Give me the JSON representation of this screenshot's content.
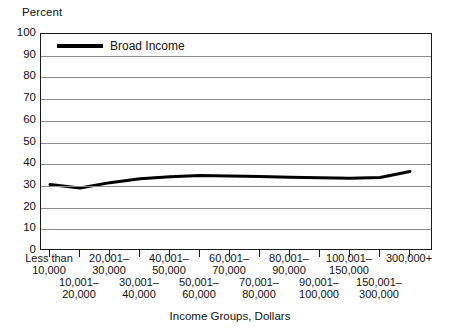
{
  "chart_data": {
    "type": "line",
    "title": "",
    "ylabel": "Percent",
    "xlabel": "Income Groups, Dollars",
    "ylim": [
      0,
      100
    ],
    "yticks": [
      0,
      10,
      20,
      30,
      40,
      50,
      60,
      70,
      80,
      90,
      100
    ],
    "grid": true,
    "legend_position": "inside-top-left",
    "categories": [
      "Less than 10,000",
      "10,001-20,000",
      "20,001-30,000",
      "30,001-40,000",
      "40,001-50,000",
      "50,001-60,000",
      "60,001-70,000",
      "70,001-80,000",
      "80,001-90,000",
      "90,001-100,000",
      "100,001-150,000",
      "150,001-300,000",
      "300,000+"
    ],
    "series": [
      {
        "name": "Broad Income",
        "color": "#000000",
        "values": [
          30.6,
          29.0,
          31.5,
          33.3,
          34.2,
          34.8,
          34.6,
          34.3,
          34.0,
          33.7,
          33.5,
          33.9,
          36.6
        ]
      }
    ]
  },
  "axes": {
    "y_title": "Percent",
    "y_tick_labels": [
      "100",
      "90",
      "80",
      "70",
      "60",
      "50",
      "40",
      "30",
      "20",
      "10",
      "0"
    ],
    "x_title": "Income Groups, Dollars"
  },
  "legend": {
    "entries": [
      {
        "label": "Broad Income",
        "color": "#000000"
      }
    ]
  },
  "x_tick_labels": [
    {
      "row": "upper",
      "line1": "Less than",
      "line2": "10,000"
    },
    {
      "row": "lower",
      "line1": "10,001–",
      "line2": "20,000"
    },
    {
      "row": "upper",
      "line1": "20,001–",
      "line2": "30,000"
    },
    {
      "row": "lower",
      "line1": "30,001–",
      "line2": "40,000"
    },
    {
      "row": "upper",
      "line1": "40,001–",
      "line2": "50,000"
    },
    {
      "row": "lower",
      "line1": "50,001–",
      "line2": "60,000"
    },
    {
      "row": "upper",
      "line1": "60,001–",
      "line2": "70,000"
    },
    {
      "row": "lower",
      "line1": "70,001–",
      "line2": "80,000"
    },
    {
      "row": "upper",
      "line1": "80,001–",
      "line2": "90,000"
    },
    {
      "row": "lower",
      "line1": "90,001–",
      "line2": "100,000"
    },
    {
      "row": "upper",
      "line1": "100,001–",
      "line2": "150,000"
    },
    {
      "row": "lower",
      "line1": "150,001–",
      "line2": "300,000"
    },
    {
      "row": "upper",
      "line1": "300,000+",
      "line2": ""
    }
  ],
  "colors": {
    "series_line": "#000000",
    "gridline": "#8d8d8d",
    "frame": "#1a1a1a",
    "background": "#ffffff"
  }
}
